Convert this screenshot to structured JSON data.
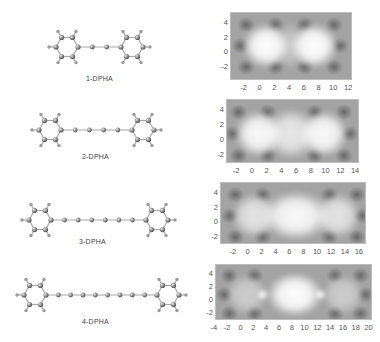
{
  "figure": {
    "rows": [
      {
        "label": "1-DPHA",
        "n_triple_bonds": 1,
        "chain_atoms": 2,
        "map": {
          "xticks": [
            "-2",
            "0",
            "2",
            "4",
            "6",
            "8",
            "10",
            "12"
          ],
          "yticks": [
            "4",
            "2",
            "0",
            "-2"
          ],
          "xlim": [
            -4,
            12.5
          ],
          "ylim": [
            -3.8,
            5.5
          ]
        }
      },
      {
        "label": "2-DPHA",
        "n_triple_bonds": 2,
        "chain_atoms": 4,
        "map": {
          "xticks": [
            "-2",
            "0",
            "2",
            "4",
            "6",
            "8",
            "10",
            "12",
            "14"
          ],
          "yticks": [
            "4",
            "2",
            "0",
            "-2"
          ],
          "xlim": [
            -3.5,
            14.5
          ],
          "ylim": [
            -3,
            5.5
          ]
        }
      },
      {
        "label": "3-DPHA",
        "n_triple_bonds": 3,
        "chain_atoms": 6,
        "map": {
          "xticks": [
            "-2",
            "0",
            "2",
            "4",
            "6",
            "8",
            "10",
            "12",
            "14",
            "16"
          ],
          "yticks": [
            "4",
            "2",
            "0",
            "-2"
          ],
          "xlim": [
            -4,
            17
          ],
          "ylim": [
            -3,
            5.5
          ]
        }
      },
      {
        "label": "4-DPHA",
        "n_triple_bonds": 4,
        "chain_atoms": 8,
        "map": {
          "xticks": [
            "-4",
            "-2",
            "0",
            "2",
            "4",
            "6",
            "8",
            "10",
            "12",
            "14",
            "16",
            "18",
            "20"
          ],
          "yticks": [
            "4",
            "2",
            "0",
            "-2"
          ],
          "xlim": [
            -4,
            20.5
          ],
          "ylim": [
            -3,
            5.5
          ]
        }
      }
    ]
  },
  "colors": {
    "background": "#ffffff",
    "map_base": "#9e9e9e",
    "map_bright": "#ffffff",
    "map_dark": "#6a6a6a",
    "atom_carbon": "#8a8a8a",
    "atom_hydrogen": "#9a9a9a",
    "bond": "#a8a8a8"
  }
}
